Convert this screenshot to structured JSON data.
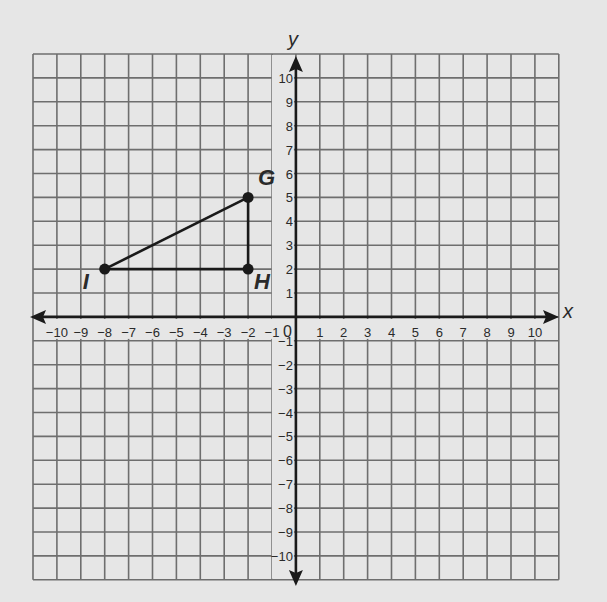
{
  "chart_data": {
    "type": "scatter",
    "title": "",
    "xlabel": "x",
    "ylabel": "y",
    "xlim": [
      -11,
      11
    ],
    "ylim": [
      -11,
      11
    ],
    "grid": true,
    "x_ticks": [
      -10,
      -9,
      -8,
      -7,
      -6,
      -5,
      -4,
      -3,
      -2,
      -1,
      1,
      2,
      3,
      4,
      5,
      6,
      7,
      8,
      9,
      10
    ],
    "y_ticks": [
      10,
      9,
      8,
      7,
      6,
      5,
      4,
      3,
      2,
      1,
      -1,
      -2,
      -3,
      -4,
      -5,
      -6,
      -7,
      -8,
      -9,
      -10
    ],
    "origin_label": "0",
    "points": [
      {
        "label": "G",
        "x": -2,
        "y": 5
      },
      {
        "label": "H",
        "x": -2,
        "y": 2
      },
      {
        "label": "I",
        "x": -8,
        "y": 2
      }
    ],
    "segments": [
      [
        "I",
        "G"
      ],
      [
        "G",
        "H"
      ],
      [
        "H",
        "I"
      ]
    ],
    "shape": "triangle GHI"
  }
}
